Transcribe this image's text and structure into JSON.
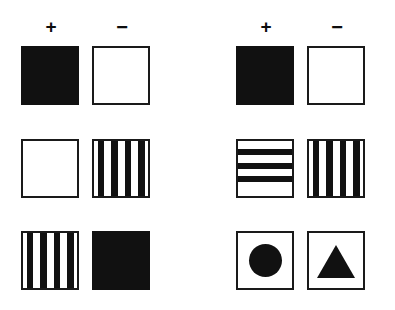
{
  "figure": {
    "panels": [
      {
        "name": "left-panel",
        "columns": [
          {
            "label": "+",
            "meaning": "positive-stimulus"
          },
          {
            "label": "−",
            "meaning": "negative-stimulus"
          }
        ],
        "rows": [
          {
            "row_label": "row-1",
            "cells": [
              {
                "shape": "solid-black",
                "fill_color": "#111111",
                "stripe_count": 0
              },
              {
                "shape": "white-outline",
                "fill_color": "#ffffff",
                "stripe_count": 0
              }
            ]
          },
          {
            "row_label": "row-2",
            "cells": [
              {
                "shape": "white-outline",
                "fill_color": "#ffffff",
                "stripe_count": 0
              },
              {
                "shape": "vertical-stripes",
                "fill_color": "#ffffff",
                "stripe_count": 4
              }
            ]
          },
          {
            "row_label": "row-3",
            "cells": [
              {
                "shape": "vertical-stripes",
                "fill_color": "#ffffff",
                "stripe_count": 4
              },
              {
                "shape": "solid-black",
                "fill_color": "#111111",
                "stripe_count": 0
              }
            ]
          }
        ]
      },
      {
        "name": "right-panel",
        "columns": [
          {
            "label": "+",
            "meaning": "positive-stimulus"
          },
          {
            "label": "−",
            "meaning": "negative-stimulus"
          }
        ],
        "rows": [
          {
            "row_label": "row-1",
            "cells": [
              {
                "shape": "solid-black",
                "fill_color": "#111111",
                "stripe_count": 0
              },
              {
                "shape": "white-outline",
                "fill_color": "#ffffff",
                "stripe_count": 0
              }
            ]
          },
          {
            "row_label": "row-2",
            "cells": [
              {
                "shape": "horizontal-stripes",
                "fill_color": "#ffffff",
                "stripe_count": 3
              },
              {
                "shape": "vertical-stripes",
                "fill_color": "#ffffff",
                "stripe_count": 4
              }
            ]
          },
          {
            "row_label": "row-3",
            "cells": [
              {
                "shape": "circle-shape",
                "fill_color": "#111111",
                "stripe_count": 0
              },
              {
                "shape": "triangle-shape",
                "fill_color": "#111111",
                "stripe_count": 0
              }
            ]
          }
        ]
      }
    ],
    "colors": {
      "ink": "#111111",
      "outline": "#1a1a1a",
      "background": "#ffffff"
    }
  }
}
